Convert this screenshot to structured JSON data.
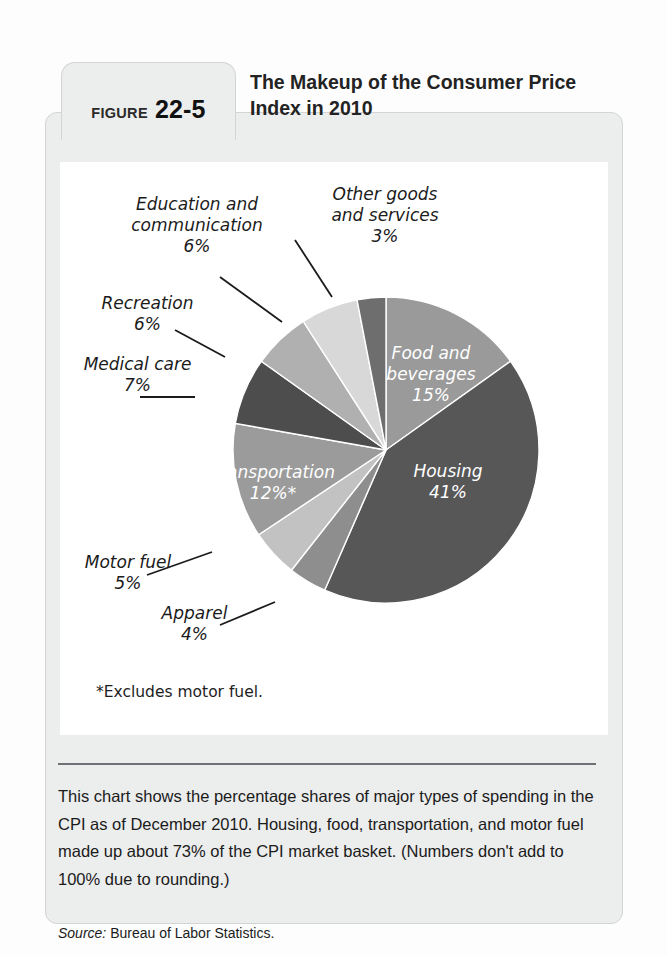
{
  "figure": {
    "label_word": "FIGURE",
    "number": "22-5",
    "title": "The Makeup of the Consumer Price Index in 2010"
  },
  "footnote": "*Excludes motor fuel.",
  "caption": "This chart shows the percentage shares of major types of spending in the CPI as of December 2010. Housing, food, transportation, and motor fuel made up about 73% of the CPI market basket. (Numbers don't add to 100% due to rounding.)",
  "source_label": "Source:",
  "source_text": "Bureau of Labor Statistics.",
  "chart_data": {
    "type": "pie",
    "title": "The Makeup of the Consumer Price Index in 2010",
    "units": "percent",
    "start_angle_deg": 0,
    "direction": "clockwise",
    "legend": "none",
    "total_labeled": 99,
    "note": "*Excludes motor fuel.",
    "categories": [
      "Food and beverages",
      "Housing",
      "Apparel",
      "Motor fuel",
      "Transportation",
      "Medical care",
      "Recreation",
      "Education and communication",
      "Other goods and services"
    ],
    "values": [
      15,
      41,
      4,
      5,
      12,
      7,
      6,
      6,
      3
    ],
    "value_labels": [
      "15%",
      "41%",
      "4%",
      "5%",
      "12%*",
      "7%",
      "6%",
      "6%",
      "3%"
    ],
    "colors": [
      "#9a9a9a",
      "#575757",
      "#8e8e8e",
      "#c2c2c2",
      "#9b9b9b",
      "#4d4d4d",
      "#b0b0b0",
      "#d8d8d8",
      "#6e6e6e"
    ],
    "slices": [
      {
        "name": "Food and beverages",
        "value": 15,
        "value_label": "15%",
        "color": "#9a9a9a",
        "label_placement": "inside",
        "label_color": "#ffffff"
      },
      {
        "name": "Housing",
        "value": 41,
        "value_label": "41%",
        "color": "#575757",
        "label_placement": "inside",
        "label_color": "#ffffff"
      },
      {
        "name": "Apparel",
        "value": 4,
        "value_label": "4%",
        "color": "#8e8e8e",
        "label_placement": "outside",
        "label_color": "#1b1b1b"
      },
      {
        "name": "Motor fuel",
        "value": 5,
        "value_label": "5%",
        "color": "#c2c2c2",
        "label_placement": "outside",
        "label_color": "#1b1b1b"
      },
      {
        "name": "Transportation",
        "value": 12,
        "value_label": "12%*",
        "color": "#9b9b9b",
        "label_placement": "inside",
        "label_color": "#ffffff"
      },
      {
        "name": "Medical care",
        "value": 7,
        "value_label": "7%",
        "color": "#4d4d4d",
        "label_placement": "outside",
        "label_color": "#1b1b1b"
      },
      {
        "name": "Recreation",
        "value": 6,
        "value_label": "6%",
        "color": "#b0b0b0",
        "label_placement": "outside",
        "label_color": "#1b1b1b"
      },
      {
        "name": "Education and communication",
        "value": 6,
        "value_label": "6%",
        "color": "#d8d8d8",
        "label_placement": "outside",
        "label_color": "#1b1b1b"
      },
      {
        "name": "Other goods and services",
        "value": 3,
        "value_label": "3%",
        "color": "#6e6e6e",
        "label_placement": "outside",
        "label_color": "#1b1b1b"
      }
    ]
  },
  "labels": {
    "education": "Education and\ncommunication\n6%",
    "recreation": "Recreation\n6%",
    "medical": "Medical care\n7%",
    "motor_fuel": "Motor fuel\n5%",
    "apparel": "Apparel\n4%",
    "other_goods": "Other goods\nand services\n3%",
    "food": "Food and\nbeverages\n15%",
    "housing": "Housing\n41%",
    "transportation": "Transportation\n12%*"
  }
}
